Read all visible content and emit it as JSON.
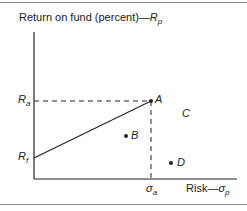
{
  "diagram": {
    "y_axis_label": "Return on fund (percent)—",
    "y_axis_symbol": "R",
    "y_axis_sub": "p",
    "x_axis_label": "Risk—",
    "x_axis_symbol": "σ",
    "x_axis_sub": "p",
    "ra_label": "R",
    "ra_sub": "a",
    "rf_label": "R",
    "rf_sub": "f",
    "sigma_a_label": "σ",
    "sigma_a_sub": "a",
    "points": [
      {
        "name": "A",
        "x": 151,
        "y": 101
      },
      {
        "name": "B",
        "x": 126,
        "y": 136
      },
      {
        "name": "C",
        "x": 185,
        "y": 113,
        "dot": false
      },
      {
        "name": "D",
        "x": 171,
        "y": 163
      }
    ],
    "labels": {
      "A": "A",
      "B": "B",
      "C": "C",
      "D": "D"
    }
  }
}
